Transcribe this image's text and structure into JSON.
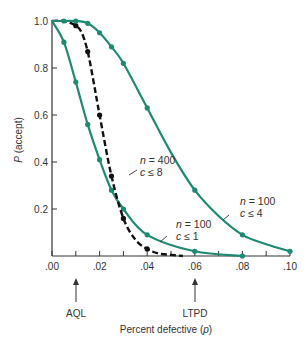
{
  "chart_data": {
    "type": "line",
    "title": "",
    "xlabel": "Percent defective (p)",
    "ylabel": "P (accept)",
    "xlim": [
      0,
      0.1
    ],
    "ylim": [
      0,
      1.0
    ],
    "grid": false,
    "x_ticks": [
      0.0,
      0.01,
      0.02,
      0.03,
      0.04,
      0.05,
      0.06,
      0.07,
      0.08,
      0.09,
      0.1
    ],
    "x_tick_labels": [
      ".00",
      ".02",
      ".04",
      ".06",
      ".08",
      ".10"
    ],
    "y_ticks": [
      0.2,
      0.4,
      0.6,
      0.8,
      1.0
    ],
    "y_tick_labels": [
      "0.2",
      "0.4",
      "0.6",
      "0.8",
      "1.0"
    ],
    "series": [
      {
        "name": "n = 100, c ≤ 1",
        "n": 100,
        "c": 1,
        "style": "solid",
        "color": "#1f8a72",
        "x": [
          0.0,
          0.005,
          0.01,
          0.015,
          0.02,
          0.025,
          0.03,
          0.04,
          0.06,
          0.08
        ],
        "y": [
          1.0,
          0.91,
          0.74,
          0.56,
          0.41,
          0.28,
          0.2,
          0.09,
          0.02,
          0.0
        ],
        "markers_x": [
          0.005,
          0.01,
          0.015,
          0.02,
          0.025,
          0.03,
          0.04,
          0.06,
          0.08
        ]
      },
      {
        "name": "n = 400, c ≤ 8",
        "n": 400,
        "c": 8,
        "style": "dashed",
        "color": "#111111",
        "x": [
          0.0,
          0.005,
          0.01,
          0.0125,
          0.015,
          0.0175,
          0.02,
          0.025,
          0.03,
          0.035,
          0.04,
          0.045,
          0.05,
          0.055
        ],
        "y": [
          1.0,
          1.0,
          0.98,
          0.95,
          0.87,
          0.74,
          0.6,
          0.34,
          0.16,
          0.07,
          0.03,
          0.01,
          0.005,
          0.0
        ],
        "markers_x": [
          0.01,
          0.015,
          0.02,
          0.025,
          0.03,
          0.04
        ]
      },
      {
        "name": "n = 100, c ≤ 4",
        "n": 100,
        "c": 4,
        "style": "solid",
        "color": "#1f8a72",
        "x": [
          0.0,
          0.005,
          0.01,
          0.015,
          0.02,
          0.025,
          0.03,
          0.04,
          0.05,
          0.06,
          0.07,
          0.08,
          0.09,
          0.1
        ],
        "y": [
          1.0,
          1.0,
          1.0,
          0.99,
          0.95,
          0.89,
          0.82,
          0.63,
          0.44,
          0.28,
          0.17,
          0.09,
          0.05,
          0.02
        ],
        "markers_x": [
          0.005,
          0.01,
          0.015,
          0.02,
          0.025,
          0.03,
          0.04,
          0.06,
          0.08,
          0.1
        ]
      }
    ],
    "annotations": [
      {
        "text_n": "n = 400",
        "text_c": "c ≤ 8",
        "target_series": "n = 400, c ≤ 8"
      },
      {
        "text_n": "n = 100",
        "text_c": "c ≤ 1",
        "target_series": "n = 100, c ≤ 1"
      },
      {
        "text_n": "n = 100",
        "text_c": "c ≤ 4",
        "target_series": "n = 100, c ≤ 4"
      }
    ],
    "markers_below_axis": [
      {
        "label": "AQL",
        "x": 0.01
      },
      {
        "label": "LTPD",
        "x": 0.06
      }
    ]
  },
  "labels": {
    "ylabel_italic": "P",
    "ylabel_rest": " (accept)",
    "xlabel_main": "Percent defective (",
    "xlabel_var": "p",
    "xlabel_close": ")",
    "aql": "AQL",
    "ltpd": "LTPD",
    "ann1_n": "n",
    "ann1_eq": " = 400",
    "ann1_c": "c",
    "ann1_le": " ≤ 8",
    "ann2_n": "n",
    "ann2_eq": " = 100",
    "ann2_c": "c",
    "ann2_le": " ≤ 1",
    "ann3_n": "n",
    "ann3_eq": " = 100",
    "ann3_c": "c",
    "ann3_le": " ≤ 4"
  }
}
